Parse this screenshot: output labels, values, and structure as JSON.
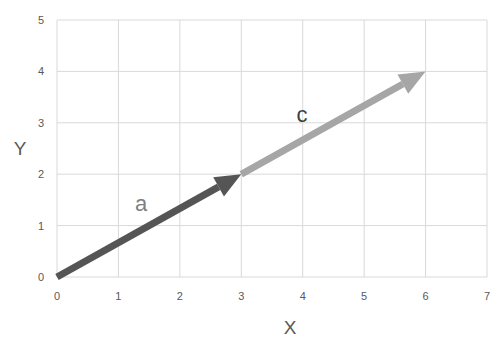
{
  "chart_data": {
    "type": "line",
    "title": "",
    "xlabel": "X",
    "ylabel": "Y",
    "xlim": [
      0,
      7
    ],
    "ylim": [
      0,
      5
    ],
    "x_ticks": [
      "0",
      "1",
      "2",
      "3",
      "4",
      "5",
      "6",
      "7"
    ],
    "y_ticks": [
      "0",
      "1",
      "2",
      "3",
      "4",
      "5"
    ],
    "grid": true,
    "legend": null,
    "series": [
      {
        "name": "a",
        "type": "vector",
        "start": [
          0,
          0
        ],
        "end": [
          3,
          2
        ],
        "color": "#555555"
      },
      {
        "name": "c",
        "type": "vector",
        "start": [
          3,
          2
        ],
        "end": [
          6,
          4
        ],
        "color": "#a6a6a6"
      }
    ],
    "annotations": [
      {
        "text": "a",
        "x": 1.35,
        "y": 1.4,
        "color": "#7f7f7f"
      },
      {
        "text": "c",
        "x": 4.0,
        "y": 3.15,
        "color": "#404040"
      }
    ]
  },
  "labels": {
    "x_axis_title": "X",
    "y_axis_title": "Y",
    "vector_a": "a",
    "vector_c": "c"
  },
  "colors": {
    "grid": "#d9d9d9",
    "vector_a": "#555555",
    "vector_c": "#a6a6a6",
    "tick_text": "#595959"
  }
}
